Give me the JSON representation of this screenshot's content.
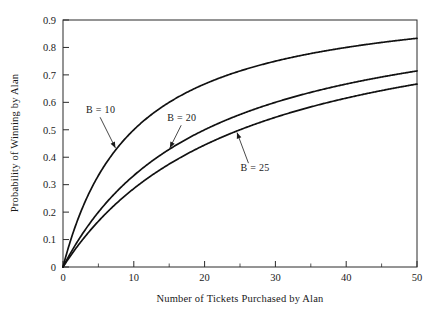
{
  "chart_data": {
    "type": "line",
    "title": "",
    "xlabel": "Number of Tickets Purchased by Alan",
    "ylabel": "Probability of Winning by Alan",
    "xlim": [
      0,
      50
    ],
    "ylim": [
      0,
      0.9
    ],
    "grid": false,
    "legend_position": "inline-annotations",
    "xticks": [
      0,
      10,
      20,
      30,
      40,
      50
    ],
    "xticklabels": [
      "0",
      "10",
      "20",
      "30",
      "40",
      "50"
    ],
    "xminorticks": [
      5,
      15,
      25,
      35,
      45
    ],
    "yticks": [
      0,
      0.1,
      0.2,
      0.3,
      0.4,
      0.5,
      0.6,
      0.7,
      0.8,
      0.9
    ],
    "yticklabels": [
      "0",
      "0.1",
      "0.2",
      "0.3",
      "0.4",
      "0.5",
      "0.6",
      "0.7",
      "0.8",
      "0.9"
    ],
    "x": [
      0,
      1,
      2,
      3,
      4,
      5,
      6,
      7,
      8,
      9,
      10,
      12,
      14,
      16,
      18,
      20,
      22,
      25,
      28,
      30,
      33,
      36,
      40,
      44,
      47,
      50
    ],
    "series": [
      {
        "name": "B = 10",
        "label": "B = 10",
        "B": 10,
        "color": "#111111",
        "values": [
          0,
          0.091,
          0.167,
          0.231,
          0.286,
          0.333,
          0.375,
          0.412,
          0.444,
          0.474,
          0.5,
          0.545,
          0.583,
          0.615,
          0.643,
          0.667,
          0.688,
          0.714,
          0.737,
          0.75,
          0.767,
          0.783,
          0.8,
          0.815,
          0.825,
          0.833
        ],
        "annotation": {
          "text": "B = 10",
          "point_x": 7.5,
          "point_y": 0.429
        }
      },
      {
        "name": "B = 20",
        "label": "B = 20",
        "B": 20,
        "color": "#111111",
        "values": [
          0,
          0.048,
          0.091,
          0.13,
          0.167,
          0.2,
          0.231,
          0.259,
          0.286,
          0.31,
          0.333,
          0.375,
          0.412,
          0.444,
          0.474,
          0.5,
          0.524,
          0.556,
          0.583,
          0.6,
          0.623,
          0.643,
          0.667,
          0.688,
          0.701,
          0.714
        ],
        "annotation": {
          "text": "B = 20",
          "point_x": 15.0,
          "point_y": 0.429
        }
      },
      {
        "name": "B = 25",
        "label": "B = 25",
        "B": 25,
        "color": "#111111",
        "values": [
          0,
          0.038,
          0.074,
          0.107,
          0.138,
          0.167,
          0.194,
          0.219,
          0.242,
          0.265,
          0.286,
          0.324,
          0.359,
          0.39,
          0.419,
          0.444,
          0.468,
          0.5,
          0.528,
          0.545,
          0.569,
          0.59,
          0.615,
          0.638,
          0.653,
          0.667
        ],
        "annotation": {
          "text": "B = 25",
          "point_x": 24.5,
          "point_y": 0.495
        }
      }
    ]
  },
  "axes": {
    "x_title": "Number of Tickets Purchased by Alan",
    "y_title": "Probability of Winning by Alan"
  }
}
